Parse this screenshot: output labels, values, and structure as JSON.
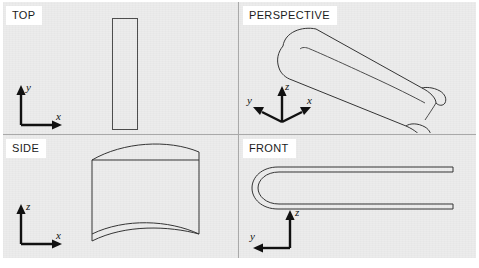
{
  "figure": {
    "background_color": "#ececec",
    "paper_color": "#ffffff",
    "line_color": "#4c4c4c",
    "divider_color": "#a9a9a9",
    "axis_color": "#111111"
  },
  "panels": [
    {
      "id": "top",
      "label": "TOP",
      "position": "top-left",
      "description": "Plan view of the airfoil: a tall narrow rectangle",
      "axes": {
        "vertical_label": "y",
        "horizontal_label": "x",
        "vertical_dir": "up",
        "horizontal_dir": "right"
      }
    },
    {
      "id": "perspective",
      "label": "PERSPECTIVE",
      "position": "top-right",
      "description": "Three-quarter pictorial view of the swept airfoil body",
      "axes": {
        "vertical_label": "z",
        "left_label": "y",
        "right_label": "x",
        "vertical_dir": "up",
        "left_dir": "down-left",
        "right_dir": "down-right"
      }
    },
    {
      "id": "side",
      "label": "SIDE",
      "position": "bottom-left",
      "description": "Side elevation showing the cambered upper and lower surfaces",
      "axes": {
        "vertical_label": "z",
        "horizontal_label": "x",
        "vertical_dir": "up",
        "horizontal_dir": "right"
      }
    },
    {
      "id": "front",
      "label": "FRONT",
      "position": "bottom-right",
      "description": "Front elevation showing the thin U-shaped section with a rounded leading edge",
      "axes": {
        "vertical_label": "z",
        "horizontal_label": "y",
        "vertical_dir": "up",
        "horizontal_dir": "left"
      }
    }
  ],
  "axis_labels": {
    "x": "x",
    "y": "y",
    "z": "z"
  }
}
